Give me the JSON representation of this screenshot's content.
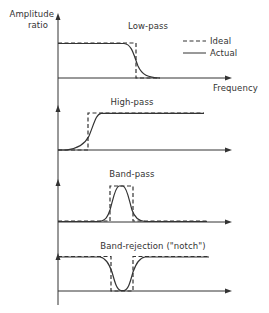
{
  "diagram": {
    "y_axis_label_line1": "Amplitude",
    "y_axis_label_line2": "ratio",
    "x_axis_label": "Frequency",
    "legend": {
      "ideal_label": "Ideal",
      "actual_label": "Actual",
      "ideal_style": "dashed",
      "actual_style": "solid"
    },
    "panels": [
      {
        "title": "Low-pass",
        "type": "low-pass"
      },
      {
        "title": "High-pass",
        "type": "high-pass"
      },
      {
        "title": "Band-pass",
        "type": "band-pass"
      },
      {
        "title": "Band-rejection (\"notch\")",
        "type": "band-rejection"
      }
    ],
    "line_color": "#333333"
  }
}
